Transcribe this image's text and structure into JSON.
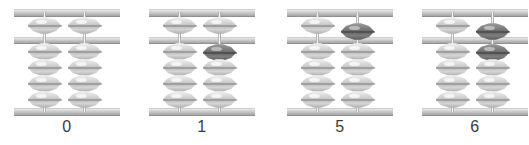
{
  "figure": {
    "type": "soroban-abacus-series",
    "background_color": "#ffffff",
    "bead_color": "#c8c8c8",
    "active_bead_color": "#6f6f6f",
    "frame_color": "#bdbdbd",
    "rod_color": "#cfcfcf"
  },
  "abacuses": [
    {
      "caption": "0",
      "value": 0,
      "left_x": 14,
      "rods": [
        {
          "name": "tens-rod",
          "upper_beads": [
            {
              "active": false,
              "position": "up"
            }
          ],
          "lower_beads": [
            {
              "active": false,
              "position": "down"
            },
            {
              "active": false,
              "position": "down"
            },
            {
              "active": false,
              "position": "down"
            },
            {
              "active": false,
              "position": "down"
            }
          ]
        },
        {
          "name": "ones-rod",
          "upper_beads": [
            {
              "active": false,
              "position": "up"
            }
          ],
          "lower_beads": [
            {
              "active": false,
              "position": "down"
            },
            {
              "active": false,
              "position": "down"
            },
            {
              "active": false,
              "position": "down"
            },
            {
              "active": false,
              "position": "down"
            }
          ]
        }
      ]
    },
    {
      "caption": "1",
      "value": 1,
      "left_x": 149,
      "rods": [
        {
          "name": "tens-rod",
          "upper_beads": [
            {
              "active": false,
              "position": "up"
            }
          ],
          "lower_beads": [
            {
              "active": false,
              "position": "down"
            },
            {
              "active": false,
              "position": "down"
            },
            {
              "active": false,
              "position": "down"
            },
            {
              "active": false,
              "position": "down"
            }
          ]
        },
        {
          "name": "ones-rod",
          "upper_beads": [
            {
              "active": false,
              "position": "up"
            }
          ],
          "lower_beads": [
            {
              "active": true,
              "position": "up"
            },
            {
              "active": false,
              "position": "down"
            },
            {
              "active": false,
              "position": "down"
            },
            {
              "active": false,
              "position": "down"
            }
          ]
        }
      ]
    },
    {
      "caption": "5",
      "value": 5,
      "left_x": 287,
      "rods": [
        {
          "name": "tens-rod",
          "upper_beads": [
            {
              "active": false,
              "position": "up"
            }
          ],
          "lower_beads": [
            {
              "active": false,
              "position": "down"
            },
            {
              "active": false,
              "position": "down"
            },
            {
              "active": false,
              "position": "down"
            },
            {
              "active": false,
              "position": "down"
            }
          ]
        },
        {
          "name": "ones-rod",
          "upper_beads": [
            {
              "active": true,
              "position": "down"
            }
          ],
          "lower_beads": [
            {
              "active": false,
              "position": "down"
            },
            {
              "active": false,
              "position": "down"
            },
            {
              "active": false,
              "position": "down"
            },
            {
              "active": false,
              "position": "down"
            }
          ]
        }
      ]
    },
    {
      "caption": "6",
      "value": 6,
      "left_x": 422,
      "rods": [
        {
          "name": "tens-rod",
          "upper_beads": [
            {
              "active": false,
              "position": "up"
            }
          ],
          "lower_beads": [
            {
              "active": false,
              "position": "down"
            },
            {
              "active": false,
              "position": "down"
            },
            {
              "active": false,
              "position": "down"
            },
            {
              "active": false,
              "position": "down"
            }
          ]
        },
        {
          "name": "ones-rod",
          "upper_beads": [
            {
              "active": true,
              "position": "down"
            }
          ],
          "lower_beads": [
            {
              "active": true,
              "position": "up"
            },
            {
              "active": false,
              "position": "down"
            },
            {
              "active": false,
              "position": "down"
            },
            {
              "active": false,
              "position": "down"
            }
          ]
        }
      ]
    }
  ]
}
